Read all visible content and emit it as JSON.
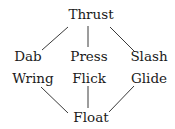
{
  "diagram": {
    "nodes": [
      {
        "id": "thrust",
        "label": "Thrust",
        "x": 91,
        "y": 15
      },
      {
        "id": "dab",
        "label": "Dab",
        "x": 28,
        "y": 57
      },
      {
        "id": "press",
        "label": "Press",
        "x": 89,
        "y": 57
      },
      {
        "id": "slash",
        "label": "Slash",
        "x": 149,
        "y": 57
      },
      {
        "id": "wring",
        "label": "Wring",
        "x": 33,
        "y": 79
      },
      {
        "id": "flick",
        "label": "Flick",
        "x": 89,
        "y": 79
      },
      {
        "id": "glide",
        "label": "Glide",
        "x": 149,
        "y": 79
      },
      {
        "id": "float",
        "label": "Float",
        "x": 91,
        "y": 118
      }
    ],
    "edges": [
      {
        "from": "thrust",
        "to": "dab",
        "x1": 68,
        "y1": 27,
        "x2": 42,
        "y2": 50
      },
      {
        "from": "thrust",
        "to": "press",
        "x1": 88,
        "y1": 26,
        "x2": 88,
        "y2": 47
      },
      {
        "from": "thrust",
        "to": "slash",
        "x1": 110,
        "y1": 27,
        "x2": 135,
        "y2": 52
      },
      {
        "from": "wring",
        "to": "float",
        "x1": 41,
        "y1": 87,
        "x2": 68,
        "y2": 113
      },
      {
        "from": "flick",
        "to": "float",
        "x1": 88,
        "y1": 86,
        "x2": 88,
        "y2": 108
      },
      {
        "from": "glide",
        "to": "float",
        "x1": 134,
        "y1": 86,
        "x2": 109,
        "y2": 112
      }
    ]
  }
}
